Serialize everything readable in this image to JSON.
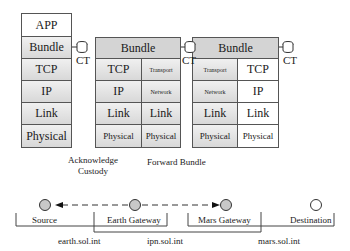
{
  "stacks": [
    {
      "name": "source-stack",
      "rows": [
        {
          "label": "APP"
        },
        {
          "label": "Bundle"
        },
        {
          "label": "TCP"
        },
        {
          "label": "IP"
        },
        {
          "label": "Link"
        },
        {
          "label": "Physical"
        }
      ],
      "ct_label": "CT"
    },
    {
      "name": "earth-gateway-stack",
      "bundle": "Bundle",
      "left": [
        "TCP",
        "IP",
        "Link",
        "Physical"
      ],
      "right": [
        "Transport",
        "Network",
        "Link",
        "Physical"
      ],
      "ct_label": "CT"
    },
    {
      "name": "mars-gateway-stack",
      "bundle": "Bundle",
      "left": [
        "Transport",
        "Network",
        "Link",
        "Physical"
      ],
      "right": [
        "TCP",
        "IP",
        "Link",
        "Physical"
      ],
      "ct_label": "CT"
    }
  ],
  "arrows": {
    "acknowledge_line1": "Acknowledge",
    "acknowledge_line2": "Custody",
    "forward": "Forward Bundle"
  },
  "nodes": [
    {
      "label": "Source",
      "filled": true
    },
    {
      "label": "Earth Gateway",
      "filled": true
    },
    {
      "label": "Mars Gateway",
      "filled": true
    },
    {
      "label": "Destination",
      "filled": false
    }
  ],
  "regions": [
    {
      "label": "earth.sol.int"
    },
    {
      "label": "ipn.sol.int"
    },
    {
      "label": "mars.sol.int"
    }
  ],
  "colors": {
    "node_fill": "#c8c8c8",
    "cell_fill": "#e0e0e0",
    "line": "#333333"
  }
}
